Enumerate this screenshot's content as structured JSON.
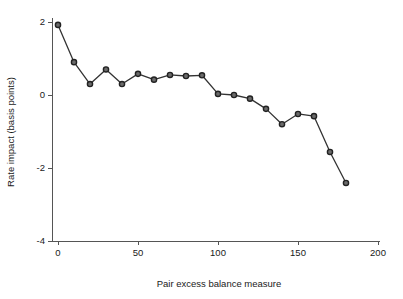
{
  "chart_data": {
    "type": "line",
    "title": "",
    "subtitle": "",
    "xlabel": "Pair excess balance measure",
    "ylabel": "Rate impact (basis points)",
    "xlim": [
      -6,
      206
    ],
    "ylim": [
      -4.35,
      2.35
    ],
    "xticks": [
      0,
      50,
      100,
      150,
      200
    ],
    "xtick_labels": [
      "0",
      "50",
      "100",
      "150",
      "200"
    ],
    "yticks": [
      2,
      0,
      -2,
      -4
    ],
    "ytick_labels": [
      "2",
      "0",
      "-2",
      "-4"
    ],
    "grid": false,
    "legend": null,
    "marker": "circle",
    "line_color": "#333333",
    "marker_face_color": "#6b6b6b",
    "marker_edge_color": "#222222",
    "x": [
      0,
      10,
      20,
      30,
      40,
      50,
      60,
      70,
      80,
      90,
      100,
      110,
      120,
      130,
      140,
      150,
      160,
      170,
      180
    ],
    "values": [
      1.92,
      0.9,
      0.3,
      0.7,
      0.3,
      0.58,
      0.42,
      0.55,
      0.52,
      0.54,
      0.03,
      0.0,
      -0.1,
      -0.38,
      -0.8,
      -0.52,
      -0.58,
      -1.56,
      -2.41
    ],
    "series": [
      {
        "name": "Rate impact",
        "x": [
          0,
          10,
          20,
          30,
          40,
          50,
          60,
          70,
          80,
          90,
          100,
          110,
          120,
          130,
          140,
          150,
          160,
          170,
          180
        ],
        "values": [
          1.92,
          0.9,
          0.3,
          0.7,
          0.3,
          0.58,
          0.42,
          0.55,
          0.52,
          0.54,
          0.03,
          0.0,
          -0.1,
          -0.38,
          -0.8,
          -0.52,
          -0.58,
          -1.56,
          -2.41
        ]
      }
    ]
  }
}
